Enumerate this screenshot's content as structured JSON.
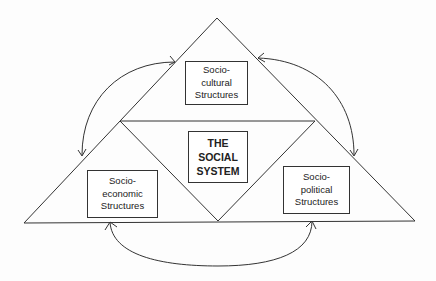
{
  "diagram": {
    "top": {
      "lines": [
        "Socio-",
        "cultural",
        "Structures"
      ]
    },
    "center": {
      "lines": [
        "THE",
        "SOCIAL",
        "SYSTEM"
      ]
    },
    "left": {
      "lines": [
        "Socio-",
        "economic",
        "Structures"
      ]
    },
    "right": {
      "lines": [
        "Socio-",
        "political",
        "Structures"
      ]
    },
    "colors": {
      "stroke": "#333333",
      "background": "#fdfdfd"
    }
  }
}
